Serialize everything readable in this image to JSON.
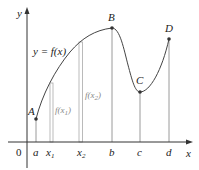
{
  "figure": {
    "function_label": "y = f(x)",
    "axes": {
      "x_label": "x",
      "y_label": "y",
      "origin_label": "0"
    },
    "x_ticks": [
      {
        "label": "a",
        "sub": ""
      },
      {
        "label": "x",
        "sub": "1"
      },
      {
        "label": "x",
        "sub": "2"
      },
      {
        "label": "b",
        "sub": ""
      },
      {
        "label": "c",
        "sub": ""
      },
      {
        "label": "d",
        "sub": ""
      }
    ],
    "points": [
      {
        "label": "A"
      },
      {
        "label": "B"
      },
      {
        "label": "C"
      },
      {
        "label": "D"
      }
    ],
    "bar_labels": [
      {
        "prefix": "f(x",
        "sub": "1",
        "suffix": ")"
      },
      {
        "prefix": "f(x",
        "sub": "2",
        "suffix": ")"
      }
    ],
    "colors": {
      "curve": "#444444",
      "axis": "#333333",
      "verticals": "#999999",
      "bars": "#aaaaaa",
      "point": "#333333"
    }
  }
}
